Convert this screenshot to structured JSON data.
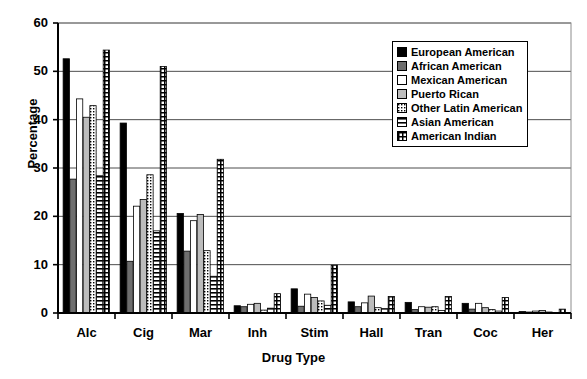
{
  "chart_data": {
    "type": "bar",
    "title": "",
    "xlabel": "Drug Type",
    "ylabel": "Percentage",
    "ylim": [
      0,
      60
    ],
    "yticks": [
      0,
      10,
      20,
      30,
      40,
      50,
      60
    ],
    "grid": true,
    "legend_position": "top-right",
    "categories": [
      "Alc",
      "Cig",
      "Mar",
      "Inh",
      "Stim",
      "Hall",
      "Tran",
      "Coc",
      "Her"
    ],
    "series": [
      {
        "name": "European American",
        "fill": "black",
        "values": [
          52.6,
          39.3,
          20.6,
          1.5,
          5.0,
          2.3,
          2.2,
          2.0,
          0.3
        ]
      },
      {
        "name": "African American",
        "fill": "darkgray",
        "values": [
          27.7,
          10.7,
          12.8,
          1.3,
          1.4,
          1.3,
          0.7,
          0.8,
          0.2
        ]
      },
      {
        "name": "Mexican American",
        "fill": "white",
        "values": [
          44.3,
          22.1,
          19.1,
          1.8,
          3.9,
          2.1,
          1.3,
          2.0,
          0.4
        ]
      },
      {
        "name": "Puerto Rican",
        "fill": "lightgray",
        "values": [
          40.5,
          23.5,
          20.4,
          2.0,
          3.2,
          3.5,
          1.2,
          1.1,
          0.5
        ]
      },
      {
        "name": "Other Latin American",
        "fill": "dots",
        "values": [
          42.9,
          28.6,
          12.9,
          0.6,
          2.5,
          1.1,
          1.3,
          0.7,
          0.2
        ]
      },
      {
        "name": "Asian American",
        "fill": "hlines",
        "values": [
          28.4,
          17.0,
          7.6,
          1.0,
          1.6,
          0.9,
          0.5,
          0.4,
          0.1
        ]
      },
      {
        "name": "American Indian",
        "fill": "grid",
        "values": [
          54.4,
          51.0,
          31.8,
          4.0,
          9.9,
          3.4,
          3.4,
          3.2,
          0.8
        ]
      }
    ]
  },
  "axis": {
    "y_title": "Percentage",
    "x_title": "Drug Type"
  }
}
